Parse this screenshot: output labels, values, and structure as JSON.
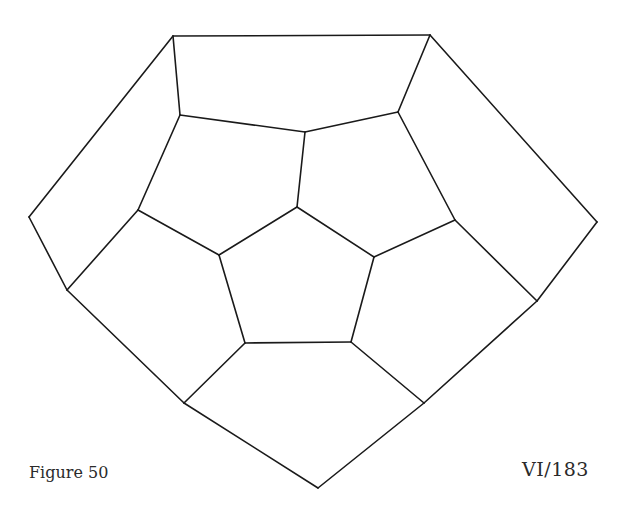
{
  "figure": {
    "label": "Figure 50",
    "reference": "VI/183",
    "stroke_color": "#1a1a1a",
    "background": "#ffffff",
    "vertices": {
      "A": [
        173,
        36
      ],
      "B": [
        430,
        35
      ],
      "C": [
        180,
        115
      ],
      "D": [
        305,
        132
      ],
      "E": [
        398,
        112
      ],
      "F": [
        29,
        217
      ],
      "G": [
        67,
        290
      ],
      "H": [
        138,
        210
      ],
      "I": [
        297,
        207
      ],
      "J": [
        219,
        255
      ],
      "K": [
        374,
        257
      ],
      "L": [
        245,
        343
      ],
      "M": [
        351,
        342
      ],
      "N": [
        455,
        220
      ],
      "O": [
        597,
        222
      ],
      "P": [
        537,
        301
      ],
      "Q": [
        184,
        403
      ],
      "R": [
        424,
        403
      ],
      "S": [
        318,
        488
      ]
    },
    "edges": [
      [
        "A",
        "B"
      ],
      [
        "A",
        "C"
      ],
      [
        "B",
        "E"
      ],
      [
        "C",
        "D"
      ],
      [
        "D",
        "E"
      ],
      [
        "A",
        "F"
      ],
      [
        "F",
        "G"
      ],
      [
        "G",
        "H"
      ],
      [
        "H",
        "C"
      ],
      [
        "B",
        "O"
      ],
      [
        "O",
        "P"
      ],
      [
        "P",
        "N"
      ],
      [
        "N",
        "E"
      ],
      [
        "D",
        "I"
      ],
      [
        "I",
        "J"
      ],
      [
        "I",
        "K"
      ],
      [
        "J",
        "L"
      ],
      [
        "L",
        "M"
      ],
      [
        "M",
        "K"
      ],
      [
        "H",
        "J"
      ],
      [
        "K",
        "N"
      ],
      [
        "G",
        "Q"
      ],
      [
        "Q",
        "L"
      ],
      [
        "M",
        "R"
      ],
      [
        "R",
        "P"
      ],
      [
        "Q",
        "S"
      ],
      [
        "R",
        "S"
      ]
    ]
  }
}
